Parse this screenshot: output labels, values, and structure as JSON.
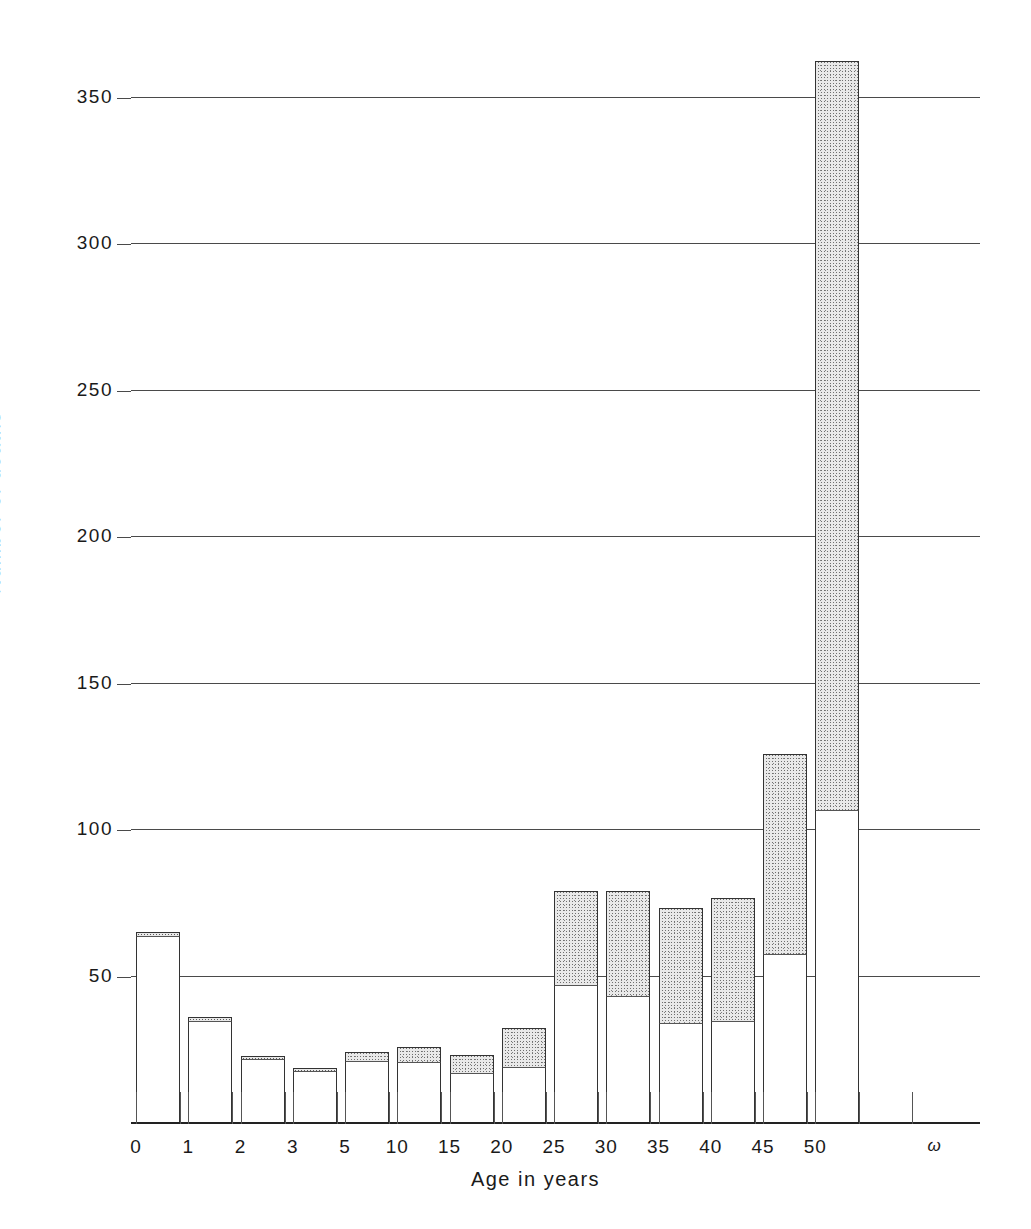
{
  "chart_data": {
    "type": "bar",
    "title": "",
    "xlabel": "Age in years",
    "ylabel": "Number of deaths",
    "ylim": [
      0,
      360
    ],
    "grid": true,
    "legend": "none",
    "stacked": true,
    "y_ticks": [
      {
        "value": 350,
        "label": "350"
      },
      {
        "value": 300,
        "label": "300"
      },
      {
        "value": 250,
        "label": "250"
      },
      {
        "value": 200,
        "label": "200"
      },
      {
        "value": 150,
        "label": "150"
      },
      {
        "value": 100,
        "label": "100"
      },
      {
        "value": 50,
        "label": "50"
      }
    ],
    "x_tick_labels": [
      "0",
      "1",
      "2",
      "3",
      "5",
      "10",
      "15",
      "20",
      "25",
      "30",
      "35",
      "40",
      "45",
      "50",
      "ω"
    ],
    "categories": [
      "0–1",
      "1–2",
      "2–3",
      "3–5",
      "5–10",
      "10–15",
      "15–20",
      "20–25",
      "25–30",
      "30–35",
      "35–40",
      "40–45",
      "45–50",
      "50–ω"
    ],
    "series": [
      {
        "name": "lower (unshaded)",
        "style": "white",
        "values": [
          63,
          34,
          21,
          17,
          20.5,
          20,
          16.5,
          18.5,
          46.5,
          42.5,
          33.5,
          34,
          57,
          106
        ]
      },
      {
        "name": "upper (stippled)",
        "style": "stippled",
        "values": [
          2,
          2,
          1.5,
          1.5,
          3.5,
          5.5,
          6.5,
          13.5,
          32.5,
          36.5,
          39.5,
          42.5,
          68.5,
          256
        ]
      }
    ],
    "totals": [
      65,
      36,
      22.5,
      18.5,
      24,
      25.5,
      23,
      32,
      79,
      79,
      73,
      76.5,
      125.5,
      362
    ]
  },
  "axis": {
    "y_title": "Number of deaths",
    "x_title": "Age in years"
  },
  "colors": {
    "ink": "#1a1a1a",
    "axis": "#222222",
    "grid": "#4a4a4a",
    "bar_lower_fill": "#ffffff",
    "bar_upper_fill": "#e9e9e9",
    "bar_outline": "#333333"
  }
}
